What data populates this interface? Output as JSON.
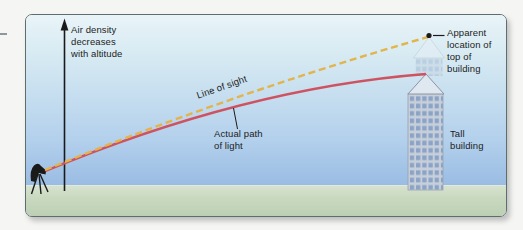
{
  "figure": {
    "labels": {
      "air_density": "Air density\ndecreases\nwith altitude",
      "line_of_sight": "Line of sight",
      "actual_path": "Actual path\nof light",
      "apparent_location": "Apparent\nlocation of\ntop of\nbuilding",
      "tall_building": "Tall\nbuilding"
    },
    "colors": {
      "sky_top": "#e9f4f8",
      "sky_bottom": "#8fb3de",
      "ground": "#c9d9c0",
      "line_of_sight_dash": "#e2b44c",
      "actual_path_red": "#ce5260",
      "ink": "#1a1a1a",
      "frame_border": "#5e6e6c",
      "building_window": "#8ba3c6",
      "building_mullion": "#c6cfda"
    },
    "icons": {
      "observer": "telescope-observer-icon",
      "altitude_arrow": "up-arrow-icon",
      "apparent_marker": "dot-marker",
      "building": "tall-building-icon",
      "ghost_building": "apparent-building-ghost"
    }
  }
}
